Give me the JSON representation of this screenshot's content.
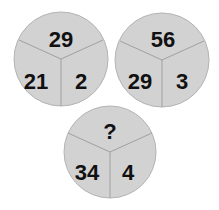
{
  "puzzle": {
    "circles": [
      {
        "top": "29",
        "left": "21",
        "right": "2"
      },
      {
        "top": "56",
        "left": "29",
        "right": "3"
      },
      {
        "top": "?",
        "left": "34",
        "right": "4"
      }
    ]
  },
  "colors": {
    "fill": "#d2d2d2",
    "stroke": "#a0a0a0",
    "text": "#111111",
    "background": "#ffffff"
  }
}
